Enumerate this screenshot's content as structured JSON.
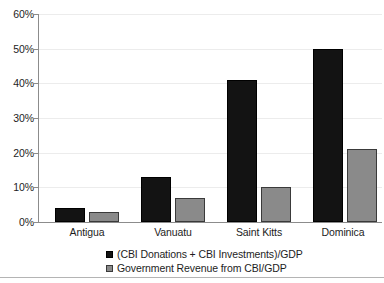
{
  "chart_data": {
    "type": "bar",
    "title": "",
    "subtitle": "",
    "xlabel": "",
    "ylabel": "",
    "categories": [
      "Antigua",
      "Vanuatu",
      "Saint Kitts",
      "Dominica"
    ],
    "series": [
      {
        "name": "(CBI Donations + CBI Investments)/GDP",
        "color": "#131313",
        "values": [
          4,
          13,
          41,
          50
        ]
      },
      {
        "name": "Government Revenue from CBI/GDP",
        "color": "#8a8a8a",
        "values": [
          3,
          7,
          10,
          21
        ]
      }
    ],
    "ylim": [
      0,
      60
    ],
    "ytick_step": 10,
    "ytick_labels": [
      "0%",
      "10%",
      "20%",
      "30%",
      "40%",
      "50%",
      "60%"
    ],
    "ytick_values": [
      0,
      10,
      20,
      30,
      40,
      50,
      60
    ],
    "value_unit": "percent",
    "grid": true,
    "grid_axis": "y",
    "legend_position": "bottom",
    "legend_entries": [
      "(CBI Donations + CBI Investments)/GDP",
      "Government Revenue from CBI/GDP"
    ]
  }
}
